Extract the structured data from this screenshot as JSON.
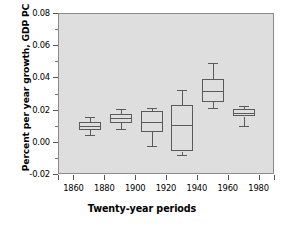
{
  "chart_data": {
    "type": "box",
    "title": "",
    "xlabel": "Twenty-year periods",
    "ylabel": "Percent per year growth, GDP PC",
    "xlim": [
      1850,
      1990
    ],
    "ylim": [
      -0.02,
      0.08
    ],
    "grid": false,
    "legend": "none",
    "xticks": [
      1860,
      1880,
      1900,
      1920,
      1940,
      1960,
      1980
    ],
    "xtick_labels": [
      "1860",
      "1880",
      "1900",
      "1920",
      "1940",
      "1960",
      "1980"
    ],
    "yticks": [
      -0.02,
      0.0,
      0.02,
      0.04,
      0.06,
      0.08
    ],
    "ytick_labels": [
      "-0.02",
      "0.00",
      "0.02",
      "0.04",
      "0.06",
      "0.08"
    ],
    "yticks_minor": [
      -0.01,
      0.01,
      0.03,
      0.05,
      0.07
    ],
    "categories": [
      "1870",
      "1890",
      "1910",
      "1930",
      "1950",
      "1970"
    ],
    "boxes": [
      {
        "label": "1870",
        "x": 1870,
        "whisker_low": 0.005,
        "q1": 0.008,
        "median": 0.0105,
        "q3": 0.0128,
        "whisker_high": 0.0163
      },
      {
        "label": "1890",
        "x": 1890,
        "whisker_low": 0.0088,
        "q1": 0.0125,
        "median": 0.0152,
        "q3": 0.0178,
        "whisker_high": 0.0212
      },
      {
        "label": "1910",
        "x": 1910,
        "whisker_low": -0.0017,
        "q1": 0.0065,
        "median": 0.0131,
        "q3": 0.0197,
        "whisker_high": 0.0215
      },
      {
        "label": "1930",
        "x": 1930,
        "whisker_low": -0.0075,
        "q1": -0.0055,
        "median": 0.0113,
        "q3": 0.0232,
        "whisker_high": 0.0331
      },
      {
        "label": "1950",
        "x": 1950,
        "whisker_low": 0.0214,
        "q1": 0.0252,
        "median": 0.0322,
        "q3": 0.0397,
        "whisker_high": 0.0495
      },
      {
        "label": "1970",
        "x": 1970,
        "whisker_low": 0.0107,
        "q1": 0.0163,
        "median": 0.0185,
        "q3": 0.0209,
        "whisker_high": 0.0229
      }
    ],
    "colors": {
      "plot_background": "#dedede",
      "frame": "#8a8a8a",
      "box_line": "#5a5a5a",
      "text": "#000000",
      "page_background": "#ffffff"
    }
  }
}
